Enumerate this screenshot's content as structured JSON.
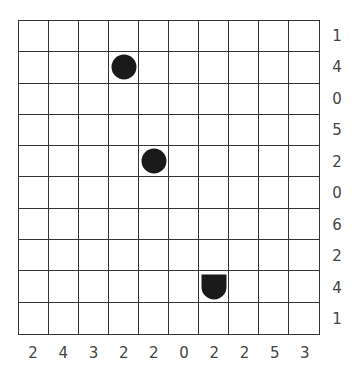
{
  "puzzle": {
    "type": "battleships",
    "rows": 10,
    "cols": 10,
    "row_clues": [
      "1",
      "4",
      "0",
      "5",
      "2",
      "0",
      "6",
      "2",
      "4",
      "1"
    ],
    "col_clues": [
      "2",
      "4",
      "3",
      "2",
      "2",
      "0",
      "2",
      "2",
      "5",
      "3"
    ],
    "pieces": [
      {
        "row": 1,
        "col": 3,
        "shape": "sub"
      },
      {
        "row": 4,
        "col": 4,
        "shape": "sub"
      },
      {
        "row": 8,
        "col": 6,
        "shape": "end-bottom"
      }
    ],
    "colors": {
      "grid": "#333333",
      "piece": "#1a1a1a",
      "clue": "#444444"
    }
  }
}
